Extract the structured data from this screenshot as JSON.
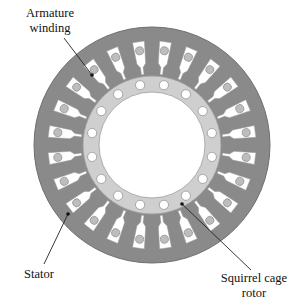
{
  "diagram": {
    "labels": {
      "armature_line1": "Armature",
      "armature_line2": "winding",
      "stator": "Stator",
      "rotor_line1": "Squirrel cage",
      "rotor_line2": "rotor"
    },
    "geometry": {
      "center": [
        152,
        145
      ],
      "stator_outer_radius": 118,
      "stator_slot_count": 24,
      "rotor_outer_radius": 69,
      "rotor_bore_radius": 53,
      "rotor_bar_count": 16,
      "rotor_bar_radius": 61
    },
    "colors": {
      "stator": "#8a8a8a",
      "stator_edge": "#6f6f6f",
      "slot": "#ffffff",
      "winding_conductor": "#bdbdbd",
      "rotor": "#cfcfcf",
      "rotor_bar": "#ffffff",
      "bore": "#ffffff",
      "text": "#111111",
      "leader": "#222222"
    }
  }
}
